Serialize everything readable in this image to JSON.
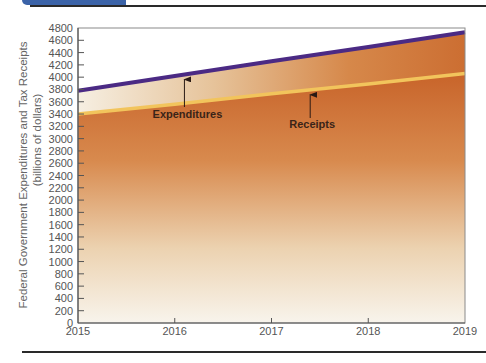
{
  "chart_data": {
    "type": "area",
    "title": "",
    "xlabel": "",
    "ylabel": "Federal Government Expenditures and Tax Receipts",
    "ylabel_sub": "(billions of dollars)",
    "x": [
      2015,
      2016,
      2017,
      2018,
      2019
    ],
    "x_tick_labels": [
      "2015",
      "2016",
      "2017",
      "2018",
      "2019"
    ],
    "y_ticks": [
      0,
      200,
      400,
      600,
      800,
      1000,
      1200,
      1400,
      1600,
      1800,
      2000,
      2200,
      2400,
      2600,
      2800,
      3000,
      3200,
      3400,
      3600,
      3800,
      4000,
      4200,
      4400,
      4600,
      4800
    ],
    "ylim": [
      0,
      4800
    ],
    "xlim": [
      2015,
      2019
    ],
    "grid": false,
    "series": [
      {
        "name": "Expenditures",
        "values": [
          3780,
          4020,
          4260,
          4490,
          4730
        ],
        "color": "#4b2a84"
      },
      {
        "name": "Receipts",
        "values": [
          3400,
          3560,
          3730,
          3890,
          4060
        ],
        "color": "#f2c45c"
      }
    ],
    "annotations": [
      {
        "text": "Expenditures",
        "x": 2016.1,
        "points_to": "Expenditures"
      },
      {
        "text": "Receipts",
        "x": 2017.4,
        "points_to": "Receipts"
      }
    ],
    "fill_colors": {
      "top": "#c8642a",
      "bottom": "#f6f2e8",
      "band_left": "#f4ecdc",
      "band_right": "#cf7a3c"
    }
  },
  "labels": {
    "ylabel_line1": "Federal Government Expenditures and Tax Receipts",
    "ylabel_line2": "(billions of dollars)",
    "expenditures": "Expenditures",
    "receipts": "Receipts"
  }
}
